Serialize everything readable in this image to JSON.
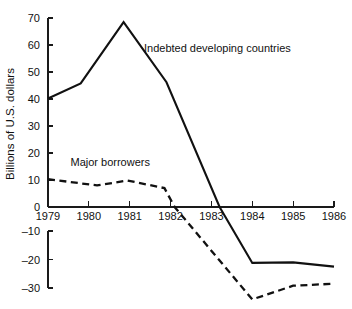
{
  "chart_data": {
    "type": "line",
    "title": "",
    "subtitle": "",
    "xlabel": "",
    "ylabel": "Billions of U.S. dollars",
    "xlim": [
      1979,
      1986
    ],
    "ylim": [
      -30,
      70
    ],
    "grid": false,
    "legend_position": "inline-annotations",
    "x_ticks": [
      "1979",
      "1980",
      "1981",
      "1982",
      "1983",
      "1984",
      "1985",
      "1986"
    ],
    "x_tick_values": [
      1979,
      1980,
      1981,
      1982,
      1983,
      1984,
      1985,
      1986
    ],
    "y_ticks": [
      "70",
      "60",
      "50",
      "40",
      "30",
      "20",
      "10",
      "0",
      "–10",
      "–20",
      "–30"
    ],
    "y_tick_values": [
      70,
      60,
      50,
      40,
      30,
      20,
      10,
      0,
      -10,
      -20,
      -30
    ],
    "series": [
      {
        "name": "Indebted developing countries",
        "style": "solid",
        "color": "#111111",
        "x": [
          1979.0,
          1979.8,
          1980.85,
          1981.9,
          1983.2,
          1984.0,
          1985.0,
          1986.0
        ],
        "values": [
          40.2,
          45.8,
          68.5,
          46.2,
          0.0,
          -21.2,
          -21.0,
          -22.5
        ]
      },
      {
        "name": "Major borrowers",
        "style": "dashed",
        "color": "#111111",
        "x": [
          1979.0,
          1980.2,
          1980.95,
          1981.85,
          1982.1,
          1984.0,
          1985.0,
          1986.0
        ],
        "values": [
          10.3,
          8.0,
          9.8,
          7.0,
          0.0,
          -34.0,
          -29.2,
          -28.5
        ]
      }
    ],
    "annotations": [
      {
        "name": "indebted-developing-countries-label",
        "text": "Indebted developing countries",
        "x": 1981.35,
        "y": 59.0
      },
      {
        "name": "major-borrowers-label",
        "text": "Major borrowers",
        "x": 1979.55,
        "y": 16.5
      }
    ]
  },
  "axis": {
    "y_title": "Billions of U.S. dollars"
  }
}
